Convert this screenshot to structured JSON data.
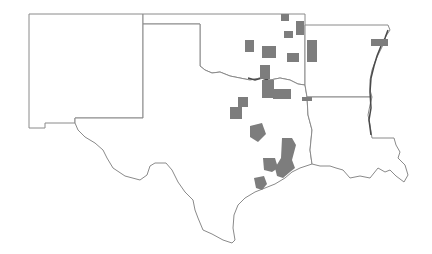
{
  "map": {
    "type": "choropleth",
    "region": "South Central United States",
    "states": [
      "New Mexico",
      "Oklahoma",
      "Texas",
      "Arkansas",
      "Louisiana"
    ],
    "legend": null,
    "colors": {
      "background": "#ffffff",
      "state_border": "#8a8a8a",
      "highlighted_county": "#7d7d7d",
      "coast_detail": "#4a4a4a"
    },
    "highlighted_regions": [
      {
        "state": "Oklahoma",
        "area": "northeast OK, near Kansas border"
      },
      {
        "state": "Oklahoma",
        "area": "north-central OK"
      },
      {
        "state": "Oklahoma",
        "area": "central OK"
      },
      {
        "state": "Oklahoma",
        "area": "eastern OK near Arkansas border"
      },
      {
        "state": "Oklahoma",
        "area": "Red River, southern OK"
      },
      {
        "state": "Arkansas",
        "area": "northeast AR near Mississippi River"
      },
      {
        "state": "Texas",
        "area": "north Texas, Red River counties"
      },
      {
        "state": "Texas",
        "area": "north-central Texas"
      },
      {
        "state": "Texas",
        "area": "central Texas"
      },
      {
        "state": "Texas",
        "area": "Houston / Gulf Coast counties"
      },
      {
        "state": "Texas",
        "area": "Matagorda / coastal counties"
      },
      {
        "state": "Texas",
        "area": "northeast TX near Louisiana border"
      }
    ]
  }
}
